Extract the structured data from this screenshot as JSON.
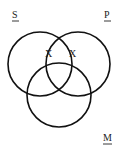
{
  "diagram": {
    "type": "venn",
    "circles": [
      {
        "id": "S",
        "label": "S",
        "cx": 40,
        "cy": 64,
        "r": 32,
        "label_x": 12,
        "label_y": 18
      },
      {
        "id": "P",
        "label": "P",
        "cx": 78,
        "cy": 64,
        "r": 32,
        "label_x": 104,
        "label_y": 18
      },
      {
        "id": "M",
        "label": "M",
        "cx": 59,
        "cy": 95,
        "r": 32,
        "label_x": 104,
        "label_y": 141
      }
    ],
    "marks": [
      {
        "text": "X",
        "x": 48,
        "y": 57,
        "region": "S-P boundary of S∩P (outside M)"
      },
      {
        "text": "X",
        "x": 72,
        "y": 57,
        "region": "S-P boundary of S∩P (outside M)"
      }
    ],
    "stroke_color": "#111111",
    "text_color": "#222222"
  }
}
